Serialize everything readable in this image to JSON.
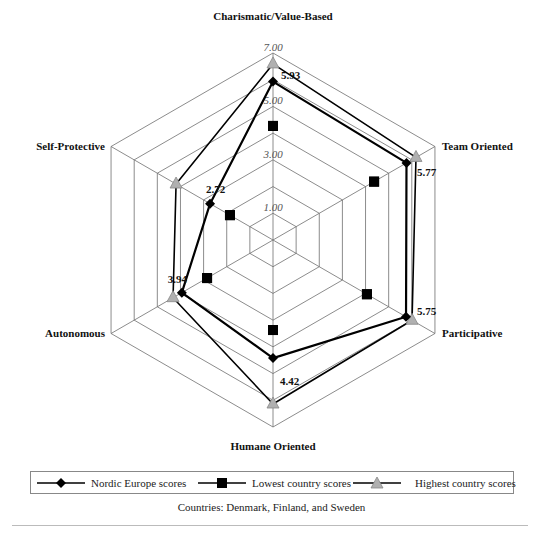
{
  "chart_data": {
    "type": "radar",
    "title": "",
    "axes": [
      "Charismatic/Value-Based",
      "Team Oriented",
      "Participative",
      "Humane Oriented",
      "Autonomous",
      "Self-Protective"
    ],
    "tick_labels": [
      "1.00",
      "3.00",
      "5.00",
      "7.00"
    ],
    "range": [
      0,
      7
    ],
    "rings": [
      1,
      2,
      3,
      4,
      5,
      6,
      7
    ],
    "series": [
      {
        "name": "Nordic Europe scores",
        "marker": "diamond",
        "color": "#000000",
        "values": [
          5.93,
          5.77,
          5.75,
          4.42,
          3.94,
          2.72
        ]
      },
      {
        "name": "Lowest country scores",
        "marker": "square",
        "color": "#000000",
        "values": [
          4.27,
          4.37,
          4.06,
          3.37,
          2.85,
          1.86
        ]
      },
      {
        "name": "Highest country scores",
        "marker": "triangle",
        "color": "#b0b0b0",
        "values": [
          6.59,
          6.18,
          6.01,
          6.14,
          4.32,
          4.19
        ]
      }
    ],
    "value_labels": [
      "5.93",
      "5.77",
      "5.75",
      "4.42",
      "3.94",
      "2.72"
    ],
    "legend_position": "bottom",
    "caption": "Countries: Denmark, Finland, and Sweden"
  },
  "legend": {
    "items": [
      {
        "label": "Nordic Europe scores"
      },
      {
        "label": "Lowest country scores"
      },
      {
        "label": "Highest country scores"
      }
    ]
  },
  "caption": "Countries: Denmark, Finland, and Sweden"
}
